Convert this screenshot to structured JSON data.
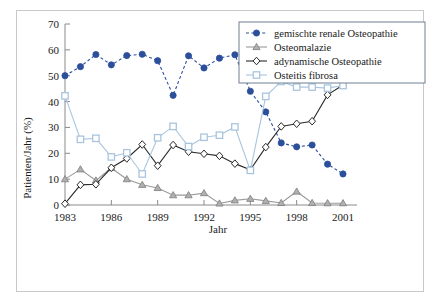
{
  "figure": {
    "frame_border_color": "#c9c9c9",
    "background": "#ffffff"
  },
  "chart_data": {
    "type": "line",
    "title": "",
    "xlabel": "Jahr",
    "ylabel": "Patienten/Jahr (%)",
    "xlim": [
      1983,
      2001
    ],
    "ylim": [
      0,
      70
    ],
    "xticks": [
      1983,
      1986,
      1989,
      1992,
      1995,
      1998,
      2001
    ],
    "xtick_labels": [
      "1983",
      "1986",
      "1989",
      "1992",
      "1995",
      "1998",
      "2001"
    ],
    "yticks": [
      0,
      10,
      20,
      30,
      40,
      50,
      60,
      70
    ],
    "ytick_labels": [
      "0",
      "10",
      "20",
      "30",
      "40",
      "50",
      "60",
      "70"
    ],
    "grid": false,
    "legend_position": "top-right",
    "x": [
      1983,
      1984,
      1985,
      1986,
      1987,
      1988,
      1989,
      1990,
      1991,
      1992,
      1993,
      1994,
      1995,
      1996,
      1997,
      1998,
      1999,
      2000,
      2001
    ],
    "series": [
      {
        "name": "gemischte renale Osteopathie",
        "color": "#2c4f9c",
        "marker": "circle-filled",
        "linestyle": "dashed",
        "values": [
          50.0,
          53.5,
          58.2,
          54.2,
          57.8,
          58.3,
          55.8,
          42.4,
          57.7,
          53.0,
          56.8,
          58.1,
          44.0,
          36.0,
          24.0,
          22.5,
          23.2,
          15.8,
          12.0
        ]
      },
      {
        "name": "Osteomalazie",
        "color": "#9a9a9a",
        "marker": "triangle-filled",
        "linestyle": "solid",
        "values": [
          10.0,
          13.8,
          9.5,
          14.3,
          10.0,
          7.8,
          6.6,
          3.8,
          3.8,
          4.6,
          0.6,
          1.8,
          2.4,
          1.6,
          0.8,
          5.2,
          0.8,
          0.7,
          0.7
        ]
      },
      {
        "name": "adynamische Osteopathie",
        "color": "#2a2a2a",
        "marker": "diamond-open",
        "linestyle": "solid",
        "values": [
          0.5,
          7.8,
          8.0,
          14.4,
          18.0,
          23.4,
          15.2,
          23.2,
          20.6,
          19.8,
          19.0,
          16.0,
          13.6,
          22.4,
          30.4,
          31.4,
          32.4,
          42.6,
          46.4
        ]
      },
      {
        "name": "Osteitis fibrosa",
        "color": "#a9c5de",
        "marker": "square-open",
        "linestyle": "solid",
        "values": [
          42.2,
          25.4,
          25.8,
          18.6,
          20.2,
          12.0,
          26.0,
          30.4,
          22.6,
          26.2,
          27.0,
          30.2,
          13.4,
          42.0,
          47.8,
          45.6,
          45.6,
          45.2,
          46.2
        ]
      }
    ]
  }
}
